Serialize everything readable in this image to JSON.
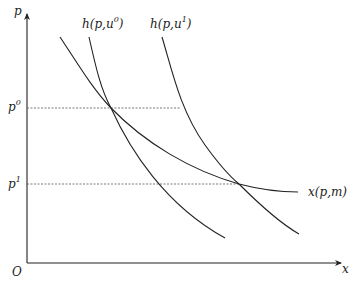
{
  "figure": {
    "type": "economics-demand-diagram",
    "axes": {
      "y_label": "p",
      "x_label": "x",
      "origin_label": "O"
    },
    "price_levels": [
      {
        "label": "p",
        "sup": "0"
      },
      {
        "label": "p",
        "sup": "1"
      }
    ],
    "curves": [
      {
        "id": "marshallian",
        "label": "x(p,m)"
      },
      {
        "id": "hicksian-u0",
        "label_main": "h(p,u",
        "label_sup": "0",
        "label_close": ")"
      },
      {
        "id": "hicksian-u1",
        "label_main": "h(p,u",
        "label_sup": "1",
        "label_close": ")"
      }
    ],
    "colors": {
      "line": "#222222",
      "dashed": "#555555",
      "background": "#ffffff"
    }
  }
}
